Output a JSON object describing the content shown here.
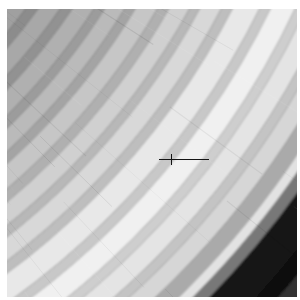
{
  "image": {
    "title": "Saturn's Rings",
    "subject": "saturn-rings",
    "caption": "Grayscale close-up of Saturn's ring system showing concentric ringlets, bright A/B ring material, and a broad dark division.",
    "alt_text": "Monochrome spacecraft image of Saturn's rings curving from upper-left to lower-right, with a thin dark fiducial crosshair near the image centre.",
    "border": {
      "color": "#ffffff",
      "top_px": 9,
      "left_px": 7,
      "right_px": 3,
      "bottom_px": 3
    },
    "frame": {
      "width_px": 290,
      "height_px": 288
    },
    "background_color": "#050505"
  },
  "fiducial": {
    "name": "reseau-crosshair",
    "color": "#141414",
    "x_px": 152,
    "y_px": 143,
    "width_px": 50,
    "height_px": 16,
    "visible": true
  },
  "geometry": {
    "ring_center_x": -455,
    "ring_center_y": -352,
    "description": "Ring plane centre lies off-frame to the upper left; bands render as concentric circular arcs."
  },
  "chart_data": {
    "type": "area",
    "title": "Saturn ring radial brightness profile",
    "xlabel": "Radial distance from ring centre (px from off-frame origin)",
    "ylabel": "Relative brightness (0-255)",
    "grid": false,
    "legend": "none",
    "bands": [
      {
        "name": "inner-shadowed-c-ring",
        "r0": 300,
        "r1": 452,
        "gray": 14,
        "hex": "#0e0e0e"
      },
      {
        "name": "c-ring-faint-ringlet-1",
        "r0": 452,
        "r1": 458,
        "gray": 34,
        "hex": "#222222"
      },
      {
        "name": "c-ring-dark-1",
        "r0": 458,
        "r1": 468,
        "gray": 16,
        "hex": "#101010"
      },
      {
        "name": "c-ring-faint-ringlet-2",
        "r0": 468,
        "r1": 474,
        "gray": 40,
        "hex": "#282828"
      },
      {
        "name": "c-ring-dark-2",
        "r0": 474,
        "r1": 486,
        "gray": 18,
        "hex": "#121212"
      },
      {
        "name": "c-ring-faint-ringlet-3",
        "r0": 486,
        "r1": 492,
        "gray": 46,
        "hex": "#2e2e2e"
      },
      {
        "name": "c-ring-dark-3",
        "r0": 492,
        "r1": 506,
        "gray": 20,
        "hex": "#141414"
      },
      {
        "name": "c-ring-faint-ringlet-4",
        "r0": 506,
        "r1": 513,
        "gray": 52,
        "hex": "#343434"
      },
      {
        "name": "c-ring-dark-4",
        "r0": 513,
        "r1": 524,
        "gray": 24,
        "hex": "#181818"
      },
      {
        "name": "c-ring-outer-rise",
        "r0": 524,
        "r1": 536,
        "gray": 58,
        "hex": "#3a3a3a"
      },
      {
        "name": "b-ring-inner-edge-step",
        "r0": 536,
        "r1": 546,
        "gray": 96,
        "hex": "#606060"
      },
      {
        "name": "b-ring-inner-bright-1",
        "r0": 546,
        "r1": 562,
        "gray": 150,
        "hex": "#969696"
      },
      {
        "name": "b-ring-trough-1",
        "r0": 562,
        "r1": 572,
        "gray": 132,
        "hex": "#848484"
      },
      {
        "name": "b-ring-bright-2",
        "r0": 572,
        "r1": 590,
        "gray": 160,
        "hex": "#a0a0a0"
      },
      {
        "name": "b-ring-trough-2",
        "r0": 590,
        "r1": 600,
        "gray": 140,
        "hex": "#8c8c8c"
      },
      {
        "name": "b-ring-bright-3",
        "r0": 600,
        "r1": 618,
        "gray": 168,
        "hex": "#a8a8a8"
      },
      {
        "name": "b-ring-trough-3",
        "r0": 618,
        "r1": 628,
        "gray": 146,
        "hex": "#929292"
      },
      {
        "name": "b-ring-bright-4",
        "r0": 628,
        "r1": 646,
        "gray": 176,
        "hex": "#b0b0b0"
      },
      {
        "name": "b-ring-trough-4",
        "r0": 646,
        "r1": 655,
        "gray": 156,
        "hex": "#9c9c9c"
      },
      {
        "name": "b-ring-bright-5",
        "r0": 655,
        "r1": 672,
        "gray": 186,
        "hex": "#bababa"
      },
      {
        "name": "b-ring-trough-5",
        "r0": 672,
        "r1": 681,
        "gray": 164,
        "hex": "#a4a4a4"
      },
      {
        "name": "b-ring-bright-6",
        "r0": 681,
        "r1": 700,
        "gray": 198,
        "hex": "#c6c6c6"
      },
      {
        "name": "b-ring-trough-6",
        "r0": 700,
        "r1": 710,
        "gray": 176,
        "hex": "#b0b0b0"
      },
      {
        "name": "b-ring-bright-7",
        "r0": 710,
        "r1": 728,
        "gray": 208,
        "hex": "#d0d0d0"
      },
      {
        "name": "b-ring-trough-7",
        "r0": 728,
        "r1": 737,
        "gray": 184,
        "hex": "#b8b8b8"
      },
      {
        "name": "b-ring-bright-8",
        "r0": 737,
        "r1": 756,
        "gray": 216,
        "hex": "#d8d8d8"
      },
      {
        "name": "b-ring-trough-8",
        "r0": 756,
        "r1": 766,
        "gray": 190,
        "hex": "#bebebe"
      },
      {
        "name": "b-ring-peak-bright-9",
        "r0": 766,
        "r1": 790,
        "gray": 232,
        "hex": "#e8e8e8"
      },
      {
        "name": "b-ring-trough-9",
        "r0": 790,
        "r1": 800,
        "gray": 200,
        "hex": "#c8c8c8"
      },
      {
        "name": "b-ring-peak-bright-10",
        "r0": 800,
        "r1": 822,
        "gray": 240,
        "hex": "#f0f0f0"
      },
      {
        "name": "b-ring-trough-10",
        "r0": 822,
        "r1": 832,
        "gray": 206,
        "hex": "#cecece"
      },
      {
        "name": "b-ring-bright-11",
        "r0": 832,
        "r1": 852,
        "gray": 228,
        "hex": "#e4e4e4"
      },
      {
        "name": "b-ring-trough-11",
        "r0": 852,
        "r1": 862,
        "gray": 196,
        "hex": "#c4c4c4"
      },
      {
        "name": "b-ring-bright-12",
        "r0": 862,
        "r1": 880,
        "gray": 214,
        "hex": "#d6d6d6"
      },
      {
        "name": "b-ring-outer-falloff",
        "r0": 880,
        "r1": 896,
        "gray": 170,
        "hex": "#aaaaaa"
      },
      {
        "name": "b-ring-outer-ringlet",
        "r0": 896,
        "r1": 906,
        "gray": 226,
        "hex": "#e2e2e2"
      },
      {
        "name": "b-ring-outer-edge",
        "r0": 906,
        "r1": 918,
        "gray": 120,
        "hex": "#787878"
      },
      {
        "name": "cassini-division-dark",
        "r0": 918,
        "r1": 952,
        "gray": 22,
        "hex": "#161616"
      },
      {
        "name": "cassini-division-core",
        "r0": 952,
        "r1": 968,
        "gray": 12,
        "hex": "#0c0c0c"
      },
      {
        "name": "division-outer-ramp",
        "r0": 968,
        "r1": 984,
        "gray": 48,
        "hex": "#303030"
      },
      {
        "name": "a-ring-inner",
        "r0": 984,
        "r1": 1010,
        "gray": 118,
        "hex": "#767676"
      },
      {
        "name": "a-ring-mid-1",
        "r0": 1010,
        "r1": 1048,
        "gray": 128,
        "hex": "#808080"
      },
      {
        "name": "a-ring-mid-2",
        "r0": 1048,
        "r1": 1086,
        "gray": 122,
        "hex": "#7a7a7a"
      },
      {
        "name": "a-ring-mid-3",
        "r0": 1086,
        "r1": 1120,
        "gray": 114,
        "hex": "#727272"
      },
      {
        "name": "encke-gap",
        "r0": 1120,
        "r1": 1131,
        "gray": 26,
        "hex": "#1a1a1a"
      },
      {
        "name": "a-ring-outer-1",
        "r0": 1131,
        "r1": 1160,
        "gray": 104,
        "hex": "#686868"
      },
      {
        "name": "a-ring-outer-2",
        "r0": 1160,
        "r1": 1186,
        "gray": 92,
        "hex": "#5c5c5c"
      },
      {
        "name": "keeler-gap",
        "r0": 1186,
        "r1": 1192,
        "gray": 24,
        "hex": "#181818"
      },
      {
        "name": "a-ring-edge",
        "r0": 1192,
        "r1": 1205,
        "gray": 74,
        "hex": "#4a4a4a"
      },
      {
        "name": "outer-space-black",
        "r0": 1205,
        "r1": 1500,
        "gray": 4,
        "hex": "#040404"
      }
    ]
  }
}
